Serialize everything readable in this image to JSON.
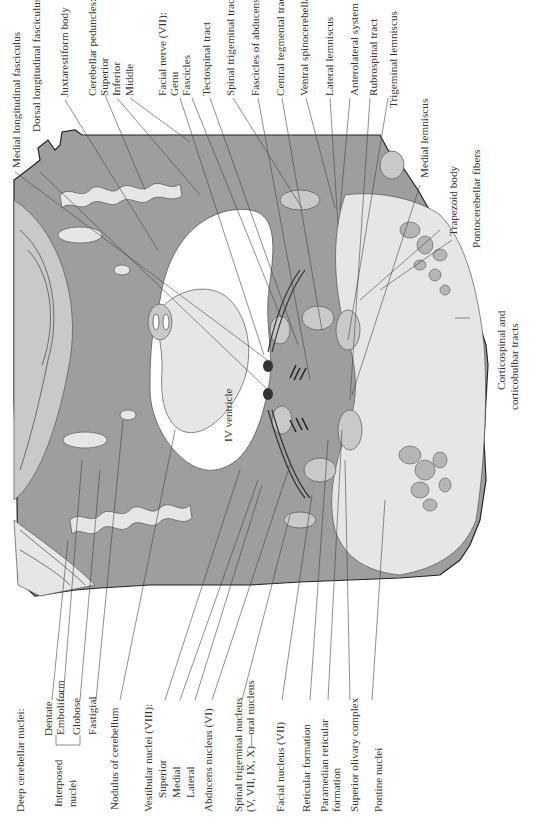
{
  "diagram": {
    "type": "anatomical cross-section",
    "structure_label": "IV ventricle",
    "labels_top": [
      "Medial longitudinal fasciculus",
      "Dorsal longitudinal fasciculus",
      "Juxtarestiform body",
      "Cerebellar peduncles:",
      "Superior",
      "Inferior",
      "Middle",
      "Facial nerve (VII):",
      "Genu",
      "Fascicles",
      "Tectospinal tract",
      "Spinal trigeminal tract (V, VII, IX)",
      "Fascicles of abducens nerve (VI)",
      "Central tegmental tract",
      "Ventral spinocerebellar tract",
      "Lateral lemniscus",
      "Anterolateral system",
      "Rubrospinal tract",
      "Trigeminal lemniscus",
      "Medial lemniscus",
      "Trapezoid body",
      "Pontocerebellar fibers"
    ],
    "labels_right": [
      "Corticospinal and",
      "corticobulbar tracts"
    ],
    "labels_bottom": [
      "Deep cerebellar nuclei:",
      "Dentate",
      "Emboliform",
      "Globose",
      "Interposed",
      "nuclei",
      "Fastigial",
      "Nodulus of cerebellum",
      "Vestibular nuclei (VIII):",
      "Superior",
      "Medial",
      "Lateral",
      "Abducens nucleus (VI)",
      "Spinal trigeminal nucleus",
      "(V, VII, IX, X)—oral nucleus",
      "Facial nucleus (VII)",
      "Reticular formation",
      "Paramedian reticular",
      "formation",
      "Superior olivary complex",
      "Pontine nuclei"
    ]
  }
}
